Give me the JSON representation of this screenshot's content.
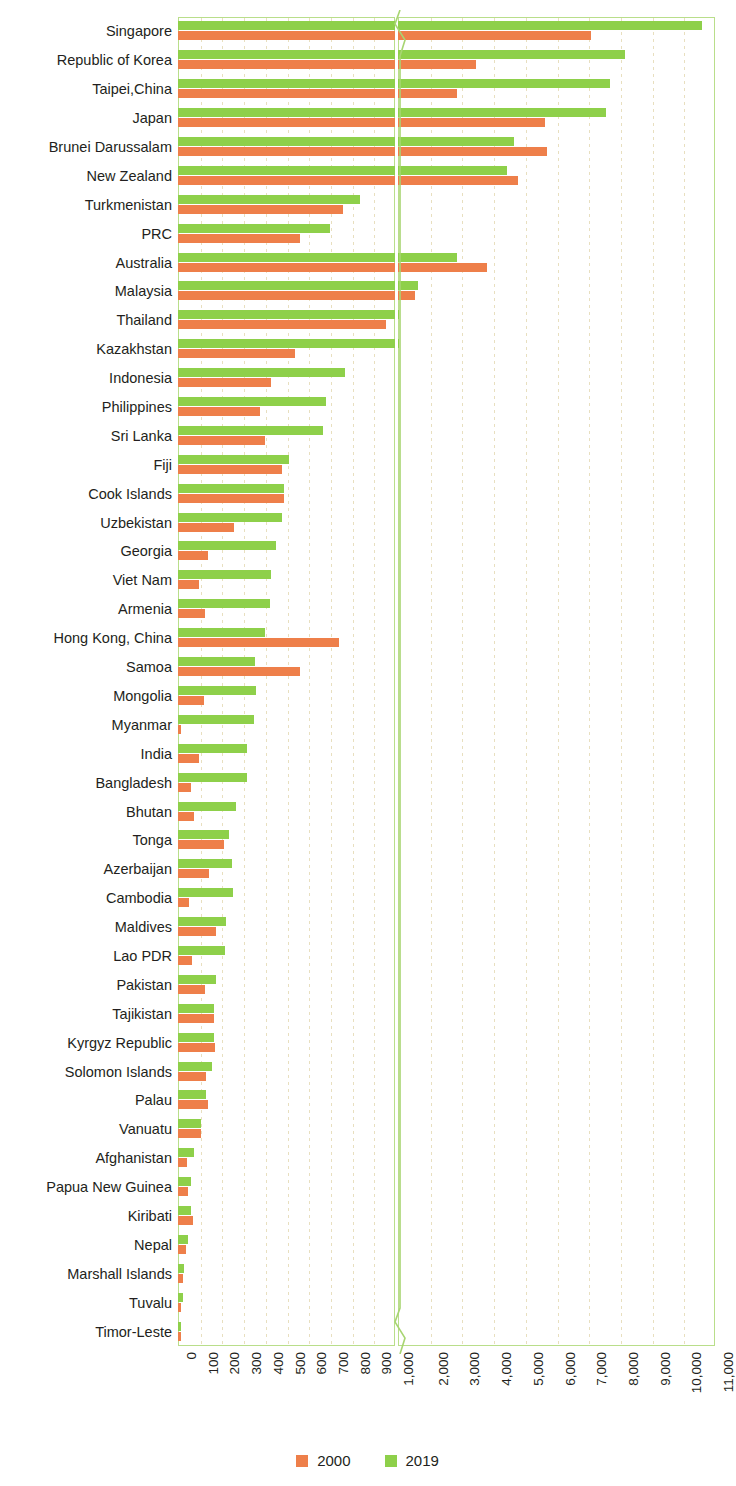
{
  "chart_data": {
    "type": "bar",
    "orientation": "horizontal",
    "title": "",
    "subtitle": "",
    "xlabel": "",
    "ylabel": "",
    "grid": true,
    "legend_position": "bottom",
    "axis_break": {
      "present": true,
      "segments": [
        {
          "min": 0,
          "max": 1000,
          "ticks": [
            0,
            100,
            200,
            300,
            400,
            500,
            600,
            700,
            800,
            900,
            1000
          ]
        },
        {
          "min": 1000,
          "max": 11000,
          "ticks": [
            1000,
            2000,
            3000,
            4000,
            5000,
            6000,
            7000,
            8000,
            9000,
            10000,
            11000
          ]
        }
      ]
    },
    "xticklabels": [
      "0",
      "100",
      "200",
      "300",
      "400",
      "500",
      "600",
      "700",
      "800",
      "900",
      "1,000",
      "2,000",
      "3,000",
      "4,000",
      "5,000",
      "6,000",
      "7,000",
      "8,000",
      "9,000",
      "10,000",
      "11,000"
    ],
    "categories": [
      "Singapore",
      "Republic of Korea",
      "Taipei,China",
      "Japan",
      "Brunei Darussalam",
      "New Zealand",
      "Turkmenistan",
      "PRC",
      "Australia",
      "Malaysia",
      "Thailand",
      "Kazakhstan",
      "Indonesia",
      "Philippines",
      "Sri Lanka",
      "Fiji",
      "Cook Islands",
      "Uzbekistan",
      "Georgia",
      "Viet Nam",
      "Armenia",
      "Hong Kong, China",
      "Samoa",
      "Mongolia",
      "Myanmar",
      "India",
      "Bangladesh",
      "Bhutan",
      "Tonga",
      "Azerbaijan",
      "Cambodia",
      "Maldives",
      "Lao PDR",
      "Pakistan",
      "Tajikistan",
      "Kyrgyz Republic",
      "Solomon Islands",
      "Palau",
      "Vanuatu",
      "Afghanistan",
      "Papua New Guinea",
      "Kiribati",
      "Nepal",
      "Marshall Islands",
      "Tuvalu",
      "Timor-Leste"
    ],
    "series": [
      {
        "name": "2000",
        "color": "#ee7f4a",
        "values": [
          7100,
          3450,
          2850,
          5650,
          5700,
          4800,
          760,
          560,
          3800,
          1540,
          960,
          540,
          430,
          380,
          400,
          480,
          490,
          260,
          140,
          95,
          125,
          740,
          560,
          120,
          15,
          95,
          60,
          75,
          210,
          145,
          50,
          175,
          65,
          125,
          165,
          170,
          130,
          140,
          105,
          40,
          45,
          70,
          35,
          22,
          15,
          12
        ]
      },
      {
        "name": "2019",
        "color": "#8ed04a",
        "values": [
          10600,
          8150,
          7700,
          7550,
          4650,
          4450,
          840,
          700,
          2850,
          1620,
          1040,
          1020,
          770,
          680,
          670,
          510,
          490,
          480,
          450,
          430,
          425,
          400,
          355,
          360,
          350,
          320,
          320,
          265,
          235,
          250,
          255,
          220,
          215,
          175,
          165,
          165,
          155,
          130,
          105,
          75,
          60,
          60,
          45,
          28,
          22,
          12
        ]
      }
    ]
  },
  "legend": {
    "items": [
      {
        "label": "2000",
        "color": "#ee7f4a"
      },
      {
        "label": "2019",
        "color": "#8ed04a"
      }
    ]
  }
}
